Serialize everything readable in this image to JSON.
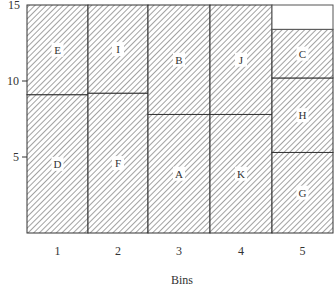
{
  "chart_data": {
    "type": "bar",
    "subtype": "stacked-bin-packing",
    "title": "",
    "xlabel": "Bins",
    "ylabel": "",
    "categories": [
      "1",
      "2",
      "3",
      "4",
      "5"
    ],
    "ylim": [
      0,
      15
    ],
    "yticks": [
      5,
      10,
      15
    ],
    "grid": false,
    "legend": null,
    "fill_pattern": "diagonal-hatch",
    "bins": [
      {
        "bin": "1",
        "capacity": 15,
        "segments": [
          {
            "label": "D",
            "from": 0,
            "to": 9.1
          },
          {
            "label": "E",
            "from": 9.1,
            "to": 15
          }
        ]
      },
      {
        "bin": "2",
        "capacity": 15,
        "segments": [
          {
            "label": "F",
            "from": 0,
            "to": 9.2
          },
          {
            "label": "I",
            "from": 9.2,
            "to": 15
          }
        ]
      },
      {
        "bin": "3",
        "capacity": 15,
        "segments": [
          {
            "label": "A",
            "from": 0,
            "to": 7.8
          },
          {
            "label": "B",
            "from": 7.8,
            "to": 15
          }
        ]
      },
      {
        "bin": "4",
        "capacity": 15,
        "segments": [
          {
            "label": "K",
            "from": 0,
            "to": 7.8
          },
          {
            "label": "J",
            "from": 7.8,
            "to": 15
          }
        ]
      },
      {
        "bin": "5",
        "capacity": 15,
        "segments": [
          {
            "label": "G",
            "from": 0,
            "to": 5.3
          },
          {
            "label": "H",
            "from": 5.3,
            "to": 10.2
          },
          {
            "label": "C",
            "from": 10.2,
            "to": 13.4
          }
        ]
      }
    ],
    "series": [
      {
        "name": "bottom item",
        "values": [
          9.1,
          9.2,
          7.8,
          7.8,
          5.3
        ],
        "labels": [
          "D",
          "F",
          "A",
          "K",
          "G"
        ]
      },
      {
        "name": "middle item",
        "values": [
          5.9,
          5.8,
          7.2,
          7.2,
          4.9
        ],
        "labels": [
          "E",
          "I",
          "B",
          "J",
          "H"
        ]
      },
      {
        "name": "top item",
        "values": [
          0,
          0,
          0,
          0,
          3.2
        ],
        "labels": [
          "",
          "",
          "",
          "",
          "C"
        ]
      }
    ]
  }
}
